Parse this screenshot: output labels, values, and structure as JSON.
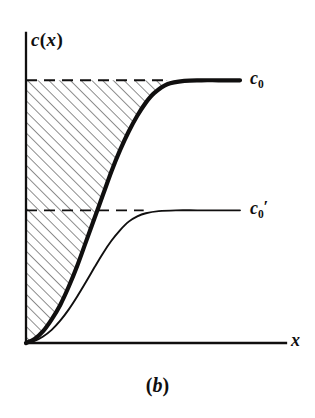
{
  "figure": {
    "caption": "(b)",
    "caption_paren_open": "(",
    "caption_letter": "b",
    "caption_paren_close": ")",
    "background_color": "#ffffff",
    "ink_color": "#100f0f",
    "hatch_color": "#3a3a3a"
  },
  "axes": {
    "y_label": "c(x)",
    "y_label_c": "c",
    "y_label_paren_open": "(",
    "y_label_x": "x",
    "y_label_paren_close": ")",
    "x_label": "x",
    "origin_px": [
      26,
      343
    ],
    "x_axis_end_px": [
      286,
      343
    ],
    "y_axis_top_px": [
      26,
      33
    ],
    "axis_line_width": 2.2
  },
  "labels": {
    "upper_curve": "c0",
    "upper_curve_base": "c",
    "upper_curve_sub": "0",
    "lower_curve": "c0'",
    "lower_curve_base": "c",
    "lower_curve_sub": "0",
    "lower_curve_prime": "′"
  },
  "chart_data": {
    "type": "line",
    "title": "(b)",
    "xlabel": "x",
    "ylabel": "c(x)",
    "grid": false,
    "legend": "none",
    "xlim": [
      0,
      1
    ],
    "ylim": [
      0,
      1.18
    ],
    "annotations": [
      {
        "text": "c0",
        "kind": "asymptote-label",
        "value": 1.0
      },
      {
        "text": "c0'",
        "kind": "asymptote-label",
        "value": 0.505
      }
    ],
    "reference_lines": [
      {
        "name": "c0-dashed",
        "y": 1.0,
        "style": "dashed",
        "x_from": 0.0,
        "x_to": 0.66
      },
      {
        "name": "c0prime-dashed",
        "y": 0.505,
        "style": "dashed",
        "x_from": 0.0,
        "x_to": 0.55
      }
    ],
    "shaded_region": {
      "name": "hatched-area",
      "pattern": "diagonal-hatch",
      "between": [
        "c0-level",
        "upper-curve"
      ],
      "x_from": 0.0,
      "x_to": 0.66
    },
    "series": [
      {
        "name": "c0-curve",
        "label": "c0",
        "style": "thick-solid",
        "asymptote": 1.0,
        "x": [
          0.0,
          0.04,
          0.08,
          0.12,
          0.16,
          0.2,
          0.24,
          0.28,
          0.32,
          0.36,
          0.4,
          0.44,
          0.48,
          0.52,
          0.56,
          0.6,
          0.66,
          0.74,
          0.82,
          0.9,
          1.0
        ],
        "y": [
          0.0,
          0.015,
          0.045,
          0.09,
          0.145,
          0.215,
          0.295,
          0.385,
          0.475,
          0.565,
          0.655,
          0.735,
          0.805,
          0.865,
          0.915,
          0.952,
          0.985,
          0.998,
          1.0,
          1.0,
          1.0
        ]
      },
      {
        "name": "c0prime-curve",
        "label": "c0'",
        "style": "thin-solid",
        "asymptote": 0.505,
        "x": [
          0.0,
          0.04,
          0.08,
          0.12,
          0.16,
          0.2,
          0.24,
          0.28,
          0.32,
          0.36,
          0.4,
          0.44,
          0.48,
          0.52,
          0.56,
          0.62,
          0.7,
          0.8,
          0.9,
          1.0
        ],
        "y": [
          0.0,
          0.008,
          0.025,
          0.05,
          0.085,
          0.128,
          0.178,
          0.232,
          0.288,
          0.342,
          0.39,
          0.43,
          0.462,
          0.482,
          0.494,
          0.502,
          0.505,
          0.505,
          0.505,
          0.505
        ]
      }
    ]
  }
}
